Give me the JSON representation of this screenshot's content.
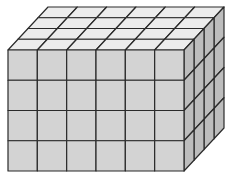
{
  "figure": {
    "dimensions": {
      "length": 6,
      "height": 4,
      "depth": 4
    },
    "total_cubes": 96,
    "colors": {
      "front": "#d3d3d3",
      "top": "#ececec",
      "side": "#bdbdbd",
      "edge": "#2a2a2a",
      "background": "#ffffff"
    }
  }
}
